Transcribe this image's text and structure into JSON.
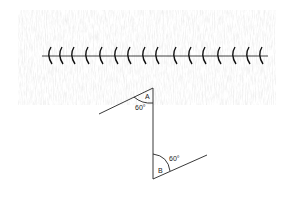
{
  "diagram": {
    "title": "",
    "barrier": {
      "tick_count": 16
    },
    "angles": [
      {
        "point": "A",
        "value": "60°"
      },
      {
        "point": "B",
        "value": "60°"
      }
    ]
  }
}
